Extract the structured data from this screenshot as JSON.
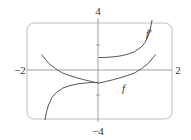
{
  "chart_data": {
    "type": "line",
    "title": "",
    "xlabel": "",
    "ylabel": "",
    "xlim": [
      -2,
      2
    ],
    "ylim": [
      -4,
      4
    ],
    "x_tick_labels": [
      "-2",
      "2"
    ],
    "y_tick_labels": [
      "4",
      "-4"
    ],
    "grid": false,
    "frame": "rounded-rectangle",
    "series": [
      {
        "name": "f",
        "label": "f",
        "x": [
          -1.6,
          -1.4,
          -1.2,
          -1.0,
          -0.8,
          -0.6,
          -0.4,
          -0.2,
          0,
          0.2,
          0.4,
          0.6,
          0.8,
          1.0,
          1.2,
          1.4,
          1.6
        ],
        "y": [
          1.25,
          0.55,
          0.1,
          -0.25,
          -0.45,
          -0.62,
          -0.78,
          -0.92,
          -1.05,
          -0.92,
          -0.78,
          -0.62,
          -0.45,
          -0.25,
          0.1,
          0.55,
          1.25
        ]
      },
      {
        "name": "f'",
        "label": "f′",
        "segments": [
          {
            "x": [
              -1.5,
              -1.45,
              -1.4,
              -1.3,
              -1.2,
              -1.0,
              -0.8,
              -0.6,
              -0.4,
              -0.2,
              0
            ],
            "y": [
              -4.0,
              -3.3,
              -2.8,
              -2.2,
              -1.85,
              -1.45,
              -1.25,
              -1.12,
              -1.05,
              -1.01,
              -1.0
            ]
          },
          {
            "x": [
              0,
              0.2,
              0.4,
              0.6,
              0.8,
              1.0,
              1.2,
              1.3,
              1.4,
              1.45,
              1.5
            ],
            "y": [
              1.0,
              1.01,
              1.05,
              1.12,
              1.25,
              1.45,
              1.85,
              2.2,
              2.8,
              3.3,
              4.0
            ]
          }
        ]
      }
    ]
  },
  "labels": {
    "x_min": "−2",
    "x_max": "2",
    "y_max": "4",
    "y_min": "−4",
    "f": "f",
    "f_prime": "f′"
  }
}
